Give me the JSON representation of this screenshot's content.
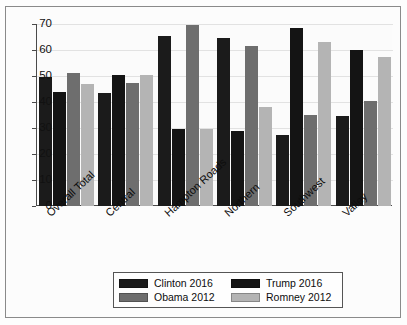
{
  "chart_data": {
    "type": "bar",
    "title": "",
    "xlabel": "",
    "ylabel": "",
    "ylim": [
      0,
      70
    ],
    "yticks": [
      0,
      10,
      20,
      30,
      40,
      50,
      60,
      70
    ],
    "grid": true,
    "legend_position": "bottom",
    "categories": [
      "Overall Total",
      "Central",
      "Hampton Roads",
      "Northern",
      "Southwest",
      "Valley"
    ],
    "series": [
      {
        "name": "Clinton 2016",
        "color": "#1b1b1b",
        "values": [
          49.5,
          43.5,
          65.5,
          64.5,
          27.5,
          34.5
        ]
      },
      {
        "name": "Trump 2016",
        "color": "#141414",
        "values": [
          44.0,
          50.5,
          29.5,
          29.0,
          68.5,
          60.0
        ]
      },
      {
        "name": "Obama 2012",
        "color": "#6e6e6e",
        "values": [
          51.0,
          47.5,
          69.5,
          61.5,
          35.0,
          40.5
        ]
      },
      {
        "name": "Romney 2012",
        "color": "#b4b4b4",
        "values": [
          47.0,
          50.5,
          29.5,
          38.0,
          63.0,
          57.5
        ]
      }
    ]
  },
  "legend": {
    "entries": [
      {
        "label": "Clinton 2016"
      },
      {
        "label": "Trump 2016"
      },
      {
        "label": "Obama 2012"
      },
      {
        "label": "Romney 2012"
      }
    ]
  }
}
